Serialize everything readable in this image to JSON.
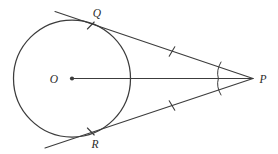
{
  "figure": {
    "kind": "geometry-diagram",
    "background_color": "#ffffff",
    "ink_color": "#3c3c3c"
  },
  "labels": {
    "center": "O",
    "tangent_point_upper": "Q",
    "tangent_point_lower": "R",
    "external_point": "P"
  },
  "geometry": {
    "circle": {
      "cx": 72,
      "cy": 78.5,
      "r": 58.5
    },
    "points": {
      "O": {
        "x": 72,
        "y": 78.5
      },
      "P": {
        "x": 253,
        "y": 78.5
      },
      "Q": {
        "x": 90.8,
        "y": 23.1
      },
      "R": {
        "x": 90.8,
        "y": 133.9
      }
    },
    "label_positions": {
      "O": {
        "x": 52,
        "y": 82
      },
      "Q": {
        "x": 92,
        "y": 16
      },
      "R": {
        "x": 91,
        "y": 147
      },
      "P": {
        "x": 259,
        "y": 82
      }
    },
    "tangent_upper": {
      "x1": 55,
      "y1": 11.5,
      "x2": 253,
      "y2": 78.5
    },
    "tangent_lower": {
      "x1": 45,
      "y1": 148,
      "x2": 253,
      "y2": 78.5
    },
    "radius_segment": {
      "x1": 72,
      "y1": 78.5,
      "x2": 253,
      "y2": 78.5
    },
    "congruence_ticks": [
      {
        "name": "tick-on-PQ",
        "cx": 172,
        "cy": 51.5
      },
      {
        "name": "tick-on-PR",
        "cx": 172,
        "cy": 105.5
      },
      {
        "name": "tick-at-Q",
        "cx": 90.8,
        "cy": 25.5
      },
      {
        "name": "tick-at-R",
        "cx": 90.8,
        "cy": 131.5
      }
    ],
    "angle_arcs": [
      {
        "name": "angle-arc-upper",
        "d": "M 219.5 63.5 Q 216.2 71.0 217.6 77.6"
      },
      {
        "name": "angle-arc-lower",
        "d": "M 217.6 79.4 Q 216.2 86.0 219.5 93.5"
      }
    ]
  }
}
